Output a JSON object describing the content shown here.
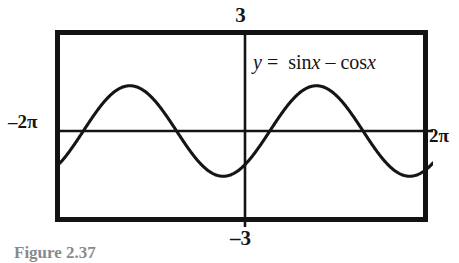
{
  "figure": {
    "caption": "Figure 2.37",
    "equation": {
      "lhs": "y",
      "equals": "=",
      "term1_fn": "sin",
      "term1_var": "x",
      "operator": "–",
      "term2_fn": "cos",
      "term2_var": "x",
      "full": "y = sin x – cos x"
    },
    "window_labels": {
      "ymax": "3",
      "ymin": "–3",
      "xmin": "–2π",
      "xmax": "2π"
    },
    "colors": {
      "frame": "#131313",
      "axis": "#151515",
      "curve": "#151515",
      "background": "#ffffff"
    }
  },
  "chart_data": {
    "type": "line",
    "title": "",
    "subtitle": "",
    "xlabel": "",
    "ylabel": "",
    "annotations": [
      "y = sin x – cos x"
    ],
    "grid": false,
    "legend": "none",
    "axis_style": "calculator-graphing-window",
    "xlim": [
      -6.283185307,
      6.283185307
    ],
    "ylim": [
      -3,
      3
    ],
    "xtick_labels": [
      "–2π",
      "2π"
    ],
    "ytick_labels": [
      "–3",
      "3"
    ],
    "series": [
      {
        "name": "y = sin x – cos x",
        "expression": "sin(x) - cos(x)",
        "amplitude": 1.41421356,
        "period": 6.283185307,
        "phase_shift": 0.785398163,
        "color": "#151515",
        "x": [
          -6.283185307,
          -5.890486,
          -5.497787,
          -5.105088,
          -4.712389,
          -4.31969,
          -3.926991,
          -3.534292,
          -3.141593,
          -2.748894,
          -2.356194,
          -1.963495,
          -1.570796,
          -1.178097,
          -0.785398,
          -0.392699,
          0.0,
          0.392699,
          0.785398,
          1.178097,
          1.570796,
          1.963495,
          2.356194,
          2.748894,
          3.141593,
          3.534292,
          3.926991,
          4.31969,
          4.712389,
          5.105088,
          5.497787,
          5.890486,
          6.283185307
        ],
        "y": [
          -1.0,
          -0.541,
          0.0,
          0.541,
          1.0,
          1.307,
          1.414,
          1.307,
          1.0,
          0.541,
          0.0,
          -0.541,
          -1.0,
          -1.307,
          -1.414,
          -1.307,
          -1.0,
          -0.541,
          0.0,
          0.541,
          1.0,
          1.307,
          1.414,
          1.307,
          1.0,
          0.541,
          0.0,
          -0.541,
          -1.0,
          -1.307,
          -1.414,
          -1.307,
          -1.0
        ]
      }
    ],
    "key_points": {
      "maxima": [
        {
          "x": -3.926991,
          "y": 1.414
        },
        {
          "x": 2.356194,
          "y": 1.414
        }
      ],
      "minima": [
        {
          "x": -0.785398,
          "y": -1.414
        },
        {
          "x": 5.497787,
          "y": -1.414
        }
      ],
      "zeros": [
        -5.497787,
        -2.356194,
        0.785398,
        3.926991
      ]
    }
  }
}
